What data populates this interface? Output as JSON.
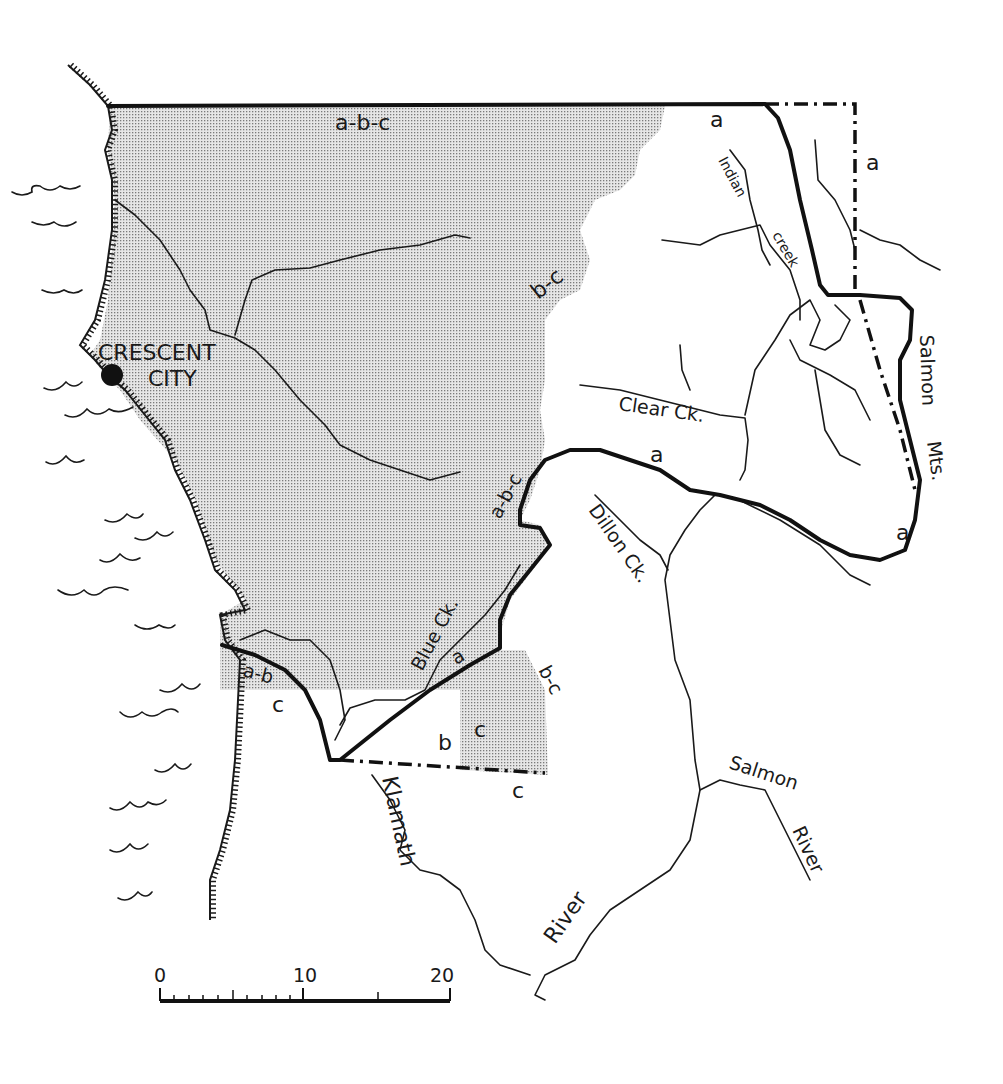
{
  "map": {
    "colors": {
      "ink": "#1a1a1a",
      "stipple": "#c9c9c9",
      "background": "#ffffff"
    },
    "city": {
      "name_line1": "CRESCENT",
      "name_line2": "CITY"
    },
    "region_labels": {
      "top_abc": "a-b-c",
      "top_a": "a",
      "east_a": "a",
      "bc_north": "b-c",
      "abc_middle": "a-b-c",
      "a_middle": "a",
      "a_southeast": "a",
      "ab_southwest": "a-b",
      "c_southwest": "c",
      "a_blue": "a",
      "bc_south": "b-c",
      "b_south": "b",
      "c_south_inner": "c",
      "c_south_outer": "c"
    },
    "water_labels": {
      "indian_creek_1": "Indian",
      "indian_creek_2": "creek",
      "clear_creek": "Clear Ck.",
      "dillon_creek": "Dillon Ck.",
      "blue_creek": "Blue Ck.",
      "klamath": "Klamath",
      "river": "River",
      "salmon_river_1": "Salmon",
      "salmon_river_2": "River"
    },
    "mountain_labels": {
      "salmon": "Salmon",
      "mts": "Mts."
    },
    "scale_bar": {
      "ticks": [
        "0",
        "10",
        "20"
      ]
    }
  }
}
